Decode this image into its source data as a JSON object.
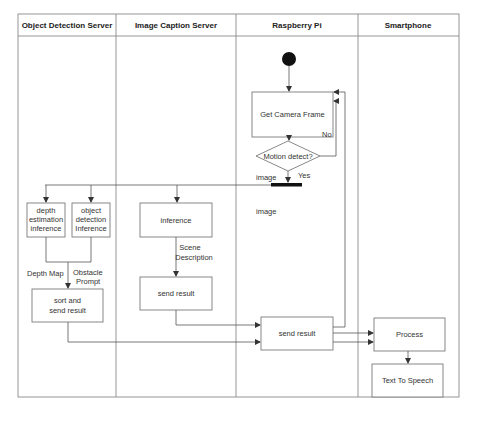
{
  "diagram": {
    "type": "uml-activity-swimlane",
    "lanes": [
      {
        "id": "ods",
        "title": "Object Detection Server"
      },
      {
        "id": "ics",
        "title": "Image Caption Server"
      },
      {
        "id": "rpi",
        "title": "Raspberry Pi"
      },
      {
        "id": "phone",
        "title": "Smartphone"
      }
    ],
    "nodes": {
      "start": {
        "type": "initial",
        "lane": "rpi"
      },
      "get_frame": {
        "label": "Get Camera Frame",
        "lane": "rpi"
      },
      "motion": {
        "label": "Motion detect?",
        "type": "decision",
        "lane": "rpi"
      },
      "fork": {
        "type": "fork",
        "lane": "rpi"
      },
      "depth": {
        "lines": [
          "depth",
          "estimation",
          "inference"
        ],
        "lane": "ods"
      },
      "object": {
        "lines": [
          "object",
          "detection",
          "Inference"
        ],
        "lane": "ods"
      },
      "inference": {
        "label": "inference",
        "lane": "ics"
      },
      "sort_send": {
        "lines": [
          "sort and",
          "send result"
        ],
        "lane": "ods"
      },
      "ics_send": {
        "label": "send result",
        "lane": "ics"
      },
      "rpi_send": {
        "label": "send result",
        "lane": "rpi"
      },
      "process": {
        "label": "Process",
        "lane": "phone"
      },
      "tts": {
        "label": "Text To Speech",
        "lane": "phone"
      }
    },
    "edge_labels": {
      "no": "No",
      "yes": "Yes",
      "image_left": "image",
      "image_below": "image",
      "depth_map": "Depth Map",
      "obstacle_prompt": [
        "Obstacle",
        "Prompt"
      ],
      "scene_description": [
        "Scene",
        "Description"
      ]
    },
    "colors": {
      "line": "#555555",
      "border": "#8a8a8a",
      "fill_dark": "#111111",
      "background": "#ffffff"
    }
  }
}
